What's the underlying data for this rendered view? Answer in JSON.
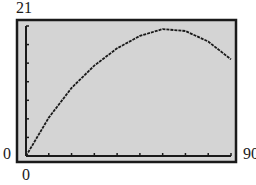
{
  "chart_data": {
    "type": "line",
    "title": "",
    "xlabel": "",
    "ylabel": "",
    "xlim": [
      0,
      90
    ],
    "ylim": [
      0,
      21
    ],
    "x_tick_labels": {
      "min": "0",
      "max": "90"
    },
    "y_tick_labels": {
      "min": "0",
      "max": "21"
    },
    "x_ticks_count": 9,
    "y_ticks_count": 7,
    "grid": false,
    "legend": null,
    "series": [
      {
        "name": "curve",
        "x": [
          0,
          10,
          20,
          30,
          40,
          50,
          60,
          70,
          80,
          90
        ],
        "y": [
          0,
          6.2,
          11.0,
          14.6,
          17.4,
          19.4,
          20.5,
          20.2,
          18.5,
          15.6
        ]
      }
    ],
    "colors": {
      "plot_background": "#d4d4d4",
      "frame": "#1a1a1a",
      "line": "#1a1a1a"
    }
  }
}
